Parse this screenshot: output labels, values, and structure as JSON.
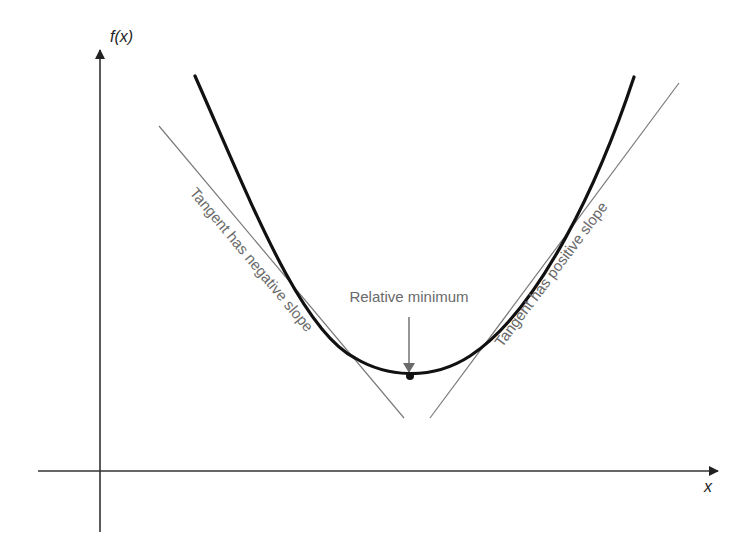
{
  "diagram": {
    "y_axis_label": "f(x)",
    "x_axis_label": "x",
    "minimum_label": "Relative minimum",
    "left_tangent_label": "Tangent has negative slope",
    "right_tangent_label": "Tangent has positive slope"
  },
  "colors": {
    "curve": "#111111",
    "tangent": "#7a7a7a",
    "axis": "#333333",
    "label": "#6a6a6a"
  }
}
